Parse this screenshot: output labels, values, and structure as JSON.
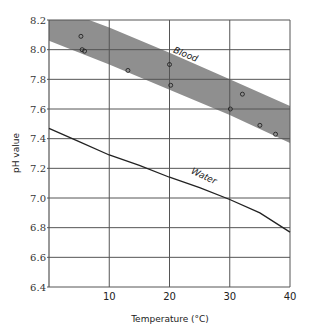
{
  "chart_data": {
    "type": "line",
    "title": "",
    "xlabel": "Temperature (°C)",
    "ylabel": "pH value",
    "xlim": [
      0,
      40
    ],
    "ylim": [
      6.4,
      8.2
    ],
    "grid": true,
    "x_ticks": [
      10,
      20,
      30,
      40
    ],
    "y_ticks": [
      6.4,
      6.6,
      6.8,
      7.0,
      7.2,
      7.4,
      7.6,
      7.8,
      8.0,
      8.2
    ],
    "y_tick_labels": [
      "6.4",
      "6.6",
      "6.8",
      "7.0",
      "7.2",
      "7.4",
      "7.6",
      "7.8",
      "8.0",
      "8.2"
    ],
    "series": [
      {
        "name": "Blood",
        "kind": "band",
        "color": "#8f8f8f",
        "x": [
          0,
          10,
          20,
          30,
          40
        ],
        "upper": [
          8.3,
          8.15,
          7.98,
          7.8,
          7.62
        ],
        "lower": [
          8.06,
          7.9,
          7.73,
          7.56,
          7.37
        ]
      },
      {
        "name": "Blood measurements",
        "kind": "scatter",
        "points": [
          [
            5.3,
            8.09
          ],
          [
            5.5,
            8.0
          ],
          [
            5.9,
            7.99
          ],
          [
            13.1,
            7.86
          ],
          [
            20.0,
            7.9
          ],
          [
            20.2,
            7.76
          ],
          [
            30.1,
            7.6
          ],
          [
            32.1,
            7.7
          ],
          [
            35.0,
            7.49
          ],
          [
            37.6,
            7.43
          ]
        ]
      },
      {
        "name": "Water",
        "kind": "line",
        "color": "#222222",
        "x": [
          0,
          5,
          10,
          15,
          20,
          25,
          30,
          35,
          40
        ],
        "values": [
          7.47,
          7.38,
          7.29,
          7.22,
          7.14,
          7.07,
          6.99,
          6.9,
          6.77
        ]
      }
    ],
    "annotations": [
      {
        "text": "Blood",
        "x": 22.5,
        "y": 7.95,
        "rotation": 22
      },
      {
        "text": "Water",
        "x": 25.5,
        "y": 7.13,
        "rotation": 25
      }
    ]
  }
}
